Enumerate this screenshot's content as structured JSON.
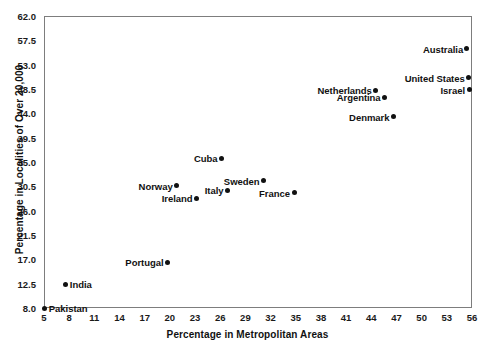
{
  "chart_data": {
    "type": "scatter",
    "title": "",
    "xlabel": "Percentage in Metropolitan Areas",
    "ylabel": "Percentage in Localities of Over 20,000",
    "xlim": [
      5,
      56
    ],
    "ylim": [
      8.0,
      62.0
    ],
    "xticks": [
      5,
      8,
      11,
      14,
      17,
      20,
      23,
      26,
      29,
      32,
      35,
      38,
      41,
      44,
      47,
      50,
      53,
      56
    ],
    "yticks": [
      8.0,
      12.5,
      17.0,
      21.5,
      26.0,
      30.5,
      35.0,
      39.5,
      44.0,
      48.5,
      53.0,
      57.5,
      62.0
    ],
    "grid": false,
    "legend": null,
    "marker_color": "#111111",
    "frame_color": "#7d7d7d",
    "points": [
      {
        "label": "Pakistan",
        "x": 5.1,
        "y": 8.0,
        "label_side": "right"
      },
      {
        "label": "India",
        "x": 7.6,
        "y": 12.4,
        "label_side": "right"
      },
      {
        "label": "Portugal",
        "x": 19.7,
        "y": 16.5,
        "label_side": "left"
      },
      {
        "label": "Norway",
        "x": 20.8,
        "y": 30.6,
        "label_side": "left"
      },
      {
        "label": "Ireland",
        "x": 23.2,
        "y": 28.3,
        "label_side": "left"
      },
      {
        "label": "Cuba",
        "x": 26.2,
        "y": 35.7,
        "label_side": "left"
      },
      {
        "label": "Italy",
        "x": 26.9,
        "y": 29.8,
        "label_side": "left"
      },
      {
        "label": "Sweden",
        "x": 31.2,
        "y": 31.5,
        "label_side": "left"
      },
      {
        "label": "France",
        "x": 34.8,
        "y": 29.3,
        "label_side": "left"
      },
      {
        "label": "Netherlands",
        "x": 44.5,
        "y": 48.3,
        "label_side": "left"
      },
      {
        "label": "Argentina",
        "x": 45.6,
        "y": 47.0,
        "label_side": "left"
      },
      {
        "label": "Denmark",
        "x": 46.6,
        "y": 43.4,
        "label_side": "left"
      },
      {
        "label": "Australia",
        "x": 55.4,
        "y": 55.9,
        "label_side": "left"
      },
      {
        "label": "United States",
        "x": 55.6,
        "y": 50.6,
        "label_side": "left"
      },
      {
        "label": "Israel",
        "x": 55.7,
        "y": 48.4,
        "label_side": "left"
      }
    ]
  }
}
